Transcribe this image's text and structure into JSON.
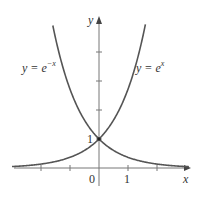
{
  "chart_data": {
    "type": "line",
    "title": "",
    "xlabel": "x",
    "ylabel": "y",
    "x_tick_labels": [
      "0",
      "1"
    ],
    "y_tick_labels": [
      "1"
    ],
    "xlim": [
      -3.0,
      3.2
    ],
    "ylim": [
      -0.3,
      5.2
    ],
    "grid": false,
    "legend": "none (inline curve labels)",
    "series": [
      {
        "name": "y = e^{-x}",
        "label_text": "y = e",
        "label_exponent": "−x",
        "x": [
          -1.9,
          -1.5,
          -1,
          -0.5,
          0,
          0.5,
          1,
          1.5,
          2,
          2.5,
          3
        ],
        "y": [
          6.69,
          4.48,
          2.72,
          1.65,
          1,
          0.61,
          0.37,
          0.22,
          0.14,
          0.08,
          0.05
        ]
      },
      {
        "name": "y = e^{x}",
        "label_text": "y = e",
        "label_exponent": "x",
        "x": [
          -3,
          -2.5,
          -2,
          -1.5,
          -1,
          -0.5,
          0,
          0.5,
          1,
          1.5,
          1.9
        ],
        "y": [
          0.05,
          0.08,
          0.14,
          0.22,
          0.37,
          0.61,
          1,
          1.65,
          2.72,
          4.48,
          6.69
        ]
      }
    ],
    "annotations": [
      {
        "text": "1",
        "at": [
          0,
          1
        ],
        "note": "intersection point of both curves, marked with a dot"
      }
    ]
  },
  "labels": {
    "y_axis": "y",
    "x_axis": "x",
    "origin": "0",
    "x_one": "1",
    "y_one": "1",
    "left_curve_base": "y = e",
    "left_curve_exp": "−x",
    "right_curve_base": "y = e",
    "right_curve_exp": "x"
  },
  "colors": {
    "curve": "#555555",
    "axis": "#777777",
    "text": "#333333"
  }
}
